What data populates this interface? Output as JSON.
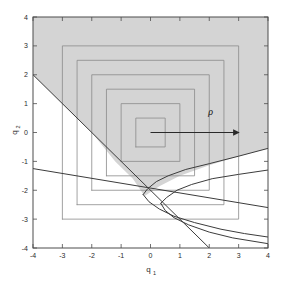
{
  "figure": {
    "background": "#ffffff",
    "plot_frame_color": "#4d4d4d",
    "shaded_region_color": "#d4d4d4",
    "contour_color": "#8a8a8a",
    "curve_color": "#3c3c3c",
    "arrow_color": "#2a2a2a"
  },
  "axes": {
    "xlabel": "q",
    "xlabel_sub": "1",
    "ylabel": "q",
    "ylabel_sub": "2",
    "xlim": [
      -4,
      4
    ],
    "ylim": [
      -4,
      4
    ],
    "xticks": [
      "-4",
      "-3",
      "-2",
      "-1",
      "0",
      "1",
      "2",
      "3",
      "4"
    ],
    "yticks": [
      "-4",
      "-3",
      "-2",
      "-1",
      "0",
      "1",
      "2",
      "3",
      "4"
    ],
    "xtick_values": [
      -4,
      -3,
      -2,
      -1,
      0,
      1,
      2,
      3,
      4
    ],
    "ytick_values": [
      -4,
      -3,
      -2,
      -1,
      0,
      1,
      2,
      3,
      4
    ],
    "grid": false
  },
  "annotations": [
    {
      "name": "rho-label",
      "text": "ρ",
      "x": 2.05,
      "y": 0.62
    }
  ],
  "arrow": {
    "name": "rho-arrow",
    "from": [
      0,
      0
    ],
    "to": [
      3.0,
      0
    ]
  },
  "chart_data": {
    "type": "line",
    "title": "",
    "xlabel": "q_1",
    "ylabel": "q_2",
    "xlim": [
      -4,
      4
    ],
    "ylim": [
      -4,
      4
    ],
    "grid": false,
    "legend": null,
    "annotations": [
      {
        "text": "ρ",
        "x": 2.05,
        "y": 0.62
      },
      {
        "type": "arrow",
        "from": [
          0,
          0
        ],
        "to": [
          3.0,
          0
        ]
      }
    ],
    "shaded_region": {
      "name": "feasible-region",
      "color": "#d4d4d4",
      "description": "Region bounded on the left by the line through (-4,2) and (2,-4), below by an upward-opening branch curve, extending up to the top-right of the axes box",
      "polygon": [
        [
          -4,
          2
        ],
        [
          -4,
          4
        ],
        [
          4,
          4
        ],
        [
          4,
          -0.55
        ],
        [
          3,
          -0.82
        ],
        [
          2,
          -1.13
        ],
        [
          1,
          -1.5
        ],
        [
          0.3,
          -1.86
        ],
        [
          -0.2,
          -2.2
        ],
        [
          -0.6,
          -1.6
        ],
        [
          -1.2,
          -1.0
        ],
        [
          -2,
          0.0
        ],
        [
          -3,
          1.0
        ]
      ]
    },
    "series": [
      {
        "name": "square-contour-0.5",
        "type": "square_contour",
        "level": 0.5,
        "points": [
          [
            -0.5,
            -0.5
          ],
          [
            0.5,
            -0.5
          ],
          [
            0.5,
            0.5
          ],
          [
            -0.5,
            0.5
          ],
          [
            -0.5,
            -0.5
          ]
        ]
      },
      {
        "name": "square-contour-1.0",
        "type": "square_contour",
        "level": 1.0,
        "points": [
          [
            -1,
            -1
          ],
          [
            1,
            -1
          ],
          [
            1,
            1
          ],
          [
            -1,
            1
          ],
          [
            -1,
            -1
          ]
        ]
      },
      {
        "name": "square-contour-1.5",
        "type": "square_contour",
        "level": 1.5,
        "points": [
          [
            -1.5,
            -1.5
          ],
          [
            1.5,
            -1.5
          ],
          [
            1.5,
            1.5
          ],
          [
            -1.5,
            1.5
          ],
          [
            -1.5,
            -1.5
          ]
        ]
      },
      {
        "name": "square-contour-2.0",
        "type": "square_contour",
        "level": 2.0,
        "points": [
          [
            -2,
            -2
          ],
          [
            2,
            -2
          ],
          [
            2,
            2
          ],
          [
            -2,
            2
          ],
          [
            -2,
            -2
          ]
        ]
      },
      {
        "name": "square-contour-2.5",
        "type": "square_contour",
        "level": 2.5,
        "points": [
          [
            -2.5,
            -2.5
          ],
          [
            2.5,
            -2.5
          ],
          [
            2.5,
            2.5
          ],
          [
            -2.5,
            2.5
          ],
          [
            -2.5,
            -2.5
          ]
        ]
      },
      {
        "name": "square-contour-3.0",
        "type": "square_contour",
        "level": 3.0,
        "points": [
          [
            -3,
            -3
          ],
          [
            3,
            -3
          ],
          [
            3,
            3
          ],
          [
            -3,
            3
          ],
          [
            -3,
            -3
          ]
        ]
      },
      {
        "name": "constraint-line-steep",
        "type": "line",
        "points": [
          [
            -4,
            2
          ],
          [
            2,
            -4
          ]
        ]
      },
      {
        "name": "constraint-line-shallow",
        "type": "line",
        "points": [
          [
            -4,
            -1.25
          ],
          [
            4,
            -2.6
          ]
        ]
      },
      {
        "name": "parabola-upper-branch",
        "type": "curve",
        "points": [
          [
            -0.25,
            -2.15
          ],
          [
            -0.1,
            -1.95
          ],
          [
            0.2,
            -1.7
          ],
          [
            0.6,
            -1.5
          ],
          [
            1.2,
            -1.28
          ],
          [
            2,
            -1.08
          ],
          [
            3,
            -0.82
          ],
          [
            4,
            -0.55
          ]
        ]
      },
      {
        "name": "parabola-lower-branch",
        "type": "curve",
        "points": [
          [
            -0.25,
            -2.15
          ],
          [
            -0.05,
            -2.4
          ],
          [
            0.3,
            -2.65
          ],
          [
            0.8,
            -2.9
          ],
          [
            1.5,
            -3.12
          ],
          [
            2.4,
            -3.35
          ],
          [
            3.2,
            -3.5
          ],
          [
            4,
            -3.62
          ]
        ]
      },
      {
        "name": "parabola2-upper-branch",
        "type": "curve",
        "points": [
          [
            0.35,
            -2.45
          ],
          [
            0.55,
            -2.25
          ],
          [
            0.9,
            -2.0
          ],
          [
            1.4,
            -1.8
          ],
          [
            2.1,
            -1.6
          ],
          [
            3,
            -1.45
          ],
          [
            4,
            -1.3
          ]
        ]
      },
      {
        "name": "parabola2-lower-branch",
        "type": "curve",
        "points": [
          [
            0.35,
            -2.45
          ],
          [
            0.5,
            -2.7
          ],
          [
            0.8,
            -2.95
          ],
          [
            1.3,
            -3.2
          ],
          [
            2,
            -3.45
          ],
          [
            2.8,
            -3.65
          ],
          [
            4,
            -3.85
          ]
        ]
      }
    ]
  }
}
